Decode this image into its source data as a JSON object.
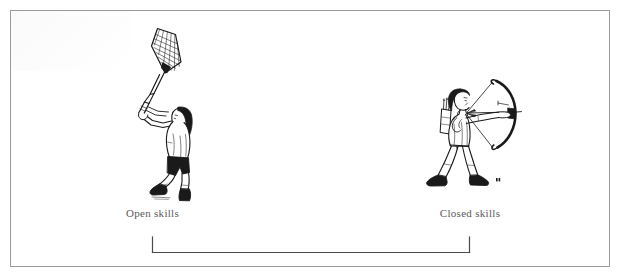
{
  "figure": {
    "background_color": "#ffffff",
    "frame_color": "#9a9a9a",
    "ink_color": "#1a1a1a",
    "caption_color": "#5a5a5a"
  },
  "captions": {
    "left": "Open skills",
    "right": "Closed skills"
  },
  "illustrations": {
    "left": {
      "name": "badminton-player",
      "description": "Badminton player with long hair reaching up, both hands gripping a racket raised overhead"
    },
    "right": {
      "name": "archer",
      "description": "Archer in a wide stance drawing a recurve bow with a quiver of arrows on the back"
    }
  },
  "bracket": {
    "name": "skills-continuum-bracket",
    "orientation": "horizontal",
    "tick_side": "up"
  }
}
